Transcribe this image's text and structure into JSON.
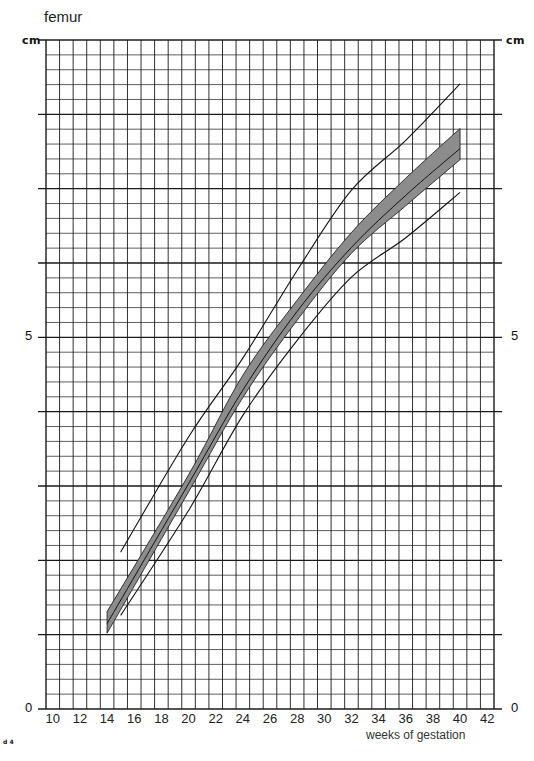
{
  "chart_data": {
    "type": "line",
    "title": "femur",
    "xlabel": "weeks of gestation",
    "ylabel": "cm",
    "xlim": [
      9.5,
      42.5
    ],
    "ylim": [
      0,
      9
    ],
    "x_ticks": [
      10,
      12,
      14,
      16,
      18,
      20,
      22,
      24,
      26,
      28,
      30,
      32,
      34,
      36,
      38,
      40,
      42
    ],
    "y_tick_labels": [
      {
        "value": 0,
        "label": "0"
      },
      {
        "value": 5,
        "label": "5"
      }
    ],
    "grid": {
      "x_minor_step": 1,
      "y_major_step": 1,
      "y_minor_step": 0.2
    },
    "series": [
      {
        "name": "upper limit",
        "style": "thin-line",
        "x": [
          15,
          20,
          24,
          28,
          32,
          36,
          40
        ],
        "values": [
          2.11,
          3.66,
          4.72,
          5.9,
          6.98,
          7.65,
          8.41
        ]
      },
      {
        "name": "band upper edge",
        "style": "band-top",
        "x": [
          14,
          20,
          24,
          28,
          32,
          36,
          40
        ],
        "values": [
          1.31,
          3.15,
          4.49,
          5.5,
          6.41,
          7.14,
          7.81
        ]
      },
      {
        "name": "median",
        "style": "band-median",
        "x": [
          14,
          20,
          24,
          28,
          32,
          36,
          40
        ],
        "values": [
          1.15,
          3.03,
          4.29,
          5.35,
          6.21,
          6.91,
          7.54
        ]
      },
      {
        "name": "band lower edge",
        "style": "band-bottom",
        "x": [
          14,
          20,
          24,
          28,
          32,
          36,
          40
        ],
        "values": [
          1.02,
          2.92,
          4.19,
          5.23,
          6.13,
          6.77,
          7.39
        ]
      },
      {
        "name": "lower limit",
        "style": "thin-line",
        "x": [
          15,
          20,
          24,
          28,
          32,
          36,
          40
        ],
        "values": [
          1.26,
          2.67,
          3.95,
          4.96,
          5.81,
          6.34,
          6.95
        ]
      }
    ],
    "colors": {
      "band_fill": "#8c8c8c",
      "line": "#111111",
      "grid": "#1a1a1a"
    }
  },
  "labels": {
    "title": "femur",
    "unit_left": "cm",
    "unit_right": "cm",
    "y_left_5": "5",
    "y_left_0": "0",
    "y_right_5": "5",
    "y_right_0": "0",
    "x_axis_title": "weeks of gestation",
    "page_mark": "d 4"
  }
}
